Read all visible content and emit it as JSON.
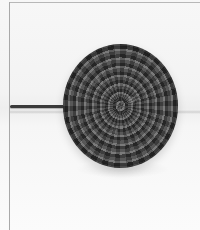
{
  "image": {
    "subject": "crocheted ball on a pin",
    "description": "Black-and-white photograph of a round crocheted ball pierced by a dark pin extending to the left, on a light background",
    "colors": {
      "background": "#f5f5f5",
      "ball": "#555555",
      "pin": "#3a3a3a",
      "frame": "#b0b0b0"
    }
  }
}
